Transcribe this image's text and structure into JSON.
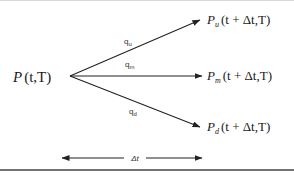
{
  "diagram": {
    "type": "trinomial-tree-branch",
    "root": {
      "base": "P",
      "args": "(t,T)"
    },
    "branches": [
      {
        "id": "up",
        "prob_base": "q",
        "prob_sub": "u",
        "node_base": "P",
        "node_sub": "u",
        "node_args": "(t + Δt,T)"
      },
      {
        "id": "middle",
        "prob_base": "q",
        "prob_sub": "m",
        "node_base": "P",
        "node_sub": "m",
        "node_args": "(t + Δt,T)"
      },
      {
        "id": "down",
        "prob_base": "q",
        "prob_sub": "d",
        "node_base": "P",
        "node_sub": "d",
        "node_args": "(t + Δt,T)"
      }
    ],
    "time_step": {
      "label": "Δt"
    }
  },
  "colors": {
    "ink": "#222222",
    "rule": "#444444",
    "background": "#ffffff"
  }
}
